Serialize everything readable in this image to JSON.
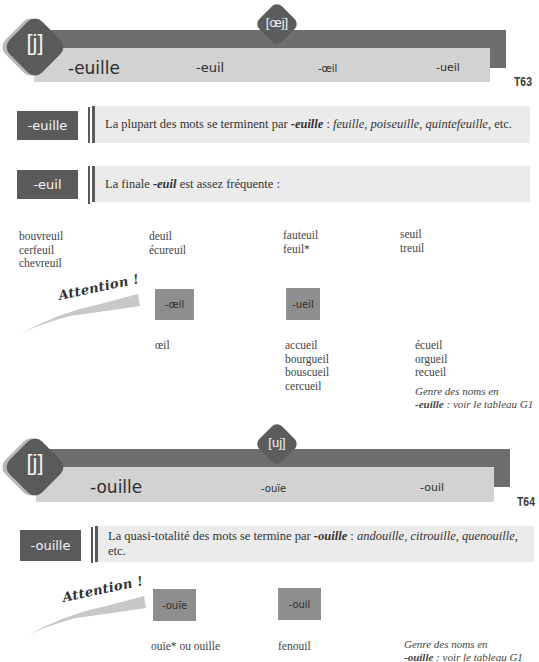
{
  "table_t63": {
    "code": "T63",
    "main_phoneme": "[j]",
    "secondary_phoneme": "[œj]",
    "headers": [
      "-euille",
      "-euil",
      "-œil",
      "-ueil"
    ],
    "rules": [
      {
        "tag": "-euille",
        "text_prefix": "La plupart des mots se terminent par ",
        "emph": "-euille",
        "text_mid": " : ",
        "examples": "feuille, poiseuille, quintefeuille",
        "text_suffix": ", etc."
      },
      {
        "tag": "-euil",
        "text_prefix": "La finale ",
        "emph": "-euil",
        "text_suffix": " est assez fréquente :"
      }
    ],
    "euil_words": [
      [
        "bouvreuil",
        "cerfeuil",
        "chevreuil"
      ],
      [
        "deuil",
        "écureuil"
      ],
      [
        "fauteuil",
        "feuil*"
      ],
      [
        "seuil",
        "treuil"
      ]
    ],
    "attention_label": "Attention !",
    "exceptions": [
      {
        "tag": "-œil",
        "words": [
          "œil"
        ]
      },
      {
        "tag": "-ueil",
        "words": [
          "accueil",
          "bourgueil",
          "bouscueil",
          "cercueil"
        ]
      }
    ],
    "ueil_words_col2": [
      "écueil",
      "orgueil",
      "recueil"
    ],
    "note": {
      "line1": "Genre des noms en",
      "emph": "-euille",
      "line2": " : voir le tableau G1"
    }
  },
  "table_t64": {
    "code": "T64",
    "main_phoneme": "[j]",
    "secondary_phoneme": "[uj]",
    "headers": [
      "-ouille",
      "-ouïe",
      "-ouil"
    ],
    "rules": [
      {
        "tag": "-ouille",
        "text_prefix": "La quasi-totalité des mots se termine par ",
        "emph": "-ouille",
        "text_mid": " : ",
        "examples": "andouille, citrouille, quenouille",
        "text_suffix": ", etc."
      }
    ],
    "attention_label": "Attention !",
    "exceptions": [
      {
        "tag": "-ouïe",
        "words": [
          "ouïe* ou ouille"
        ]
      },
      {
        "tag": "-ouil",
        "words": [
          "fenouil"
        ]
      }
    ],
    "note": {
      "line1": "Genre des noms en",
      "emph": "-ouille",
      "line2": " : voir le tableau G1"
    }
  },
  "colors": {
    "dark_gray": "#5a5a5a",
    "banner_dark": "#6e6e6e",
    "banner_light": "#d2d2d2",
    "rule_bg": "#ebebeb",
    "tag_light": "#8e8e8e"
  }
}
